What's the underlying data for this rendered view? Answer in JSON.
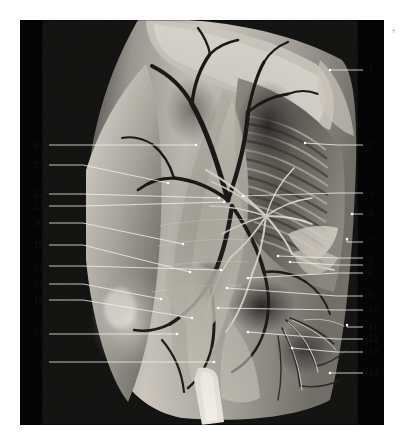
{
  "figure": {
    "kind": "anatomical-dissection-photograph",
    "panel_color": "#040404",
    "background_color": "#ffffff",
    "leader_line_color": "#f2f0ea",
    "label_color": "#111111",
    "corner_mark": "+"
  },
  "labels": {
    "left": [
      {
        "text": "24",
        "x": 44,
        "y": 145,
        "tip_x": 196,
        "tip_y": 145
      },
      {
        "text": "23",
        "x": 44,
        "y": 165,
        "tip_x": 168,
        "tip_y": 183
      },
      {
        "text": "22",
        "x": 44,
        "y": 194,
        "tip_x": 219,
        "tip_y": 198
      },
      {
        "text": "21",
        "x": 44,
        "y": 206,
        "tip_x": 224,
        "tip_y": 202
      },
      {
        "text": "20",
        "x": 44,
        "y": 223,
        "tip_x": 183,
        "tip_y": 244
      },
      {
        "text": "19",
        "x": 44,
        "y": 245,
        "tip_x": 190,
        "tip_y": 272
      },
      {
        "text": "18",
        "x": 44,
        "y": 266,
        "tip_x": 221,
        "tip_y": 270
      },
      {
        "text": "17",
        "x": 44,
        "y": 284,
        "tip_x": 161,
        "tip_y": 299
      },
      {
        "text": "16",
        "x": 44,
        "y": 300,
        "tip_x": 192,
        "tip_y": 318
      },
      {
        "text": "15",
        "x": 44,
        "y": 334,
        "tip_x": 177,
        "tip_y": 334
      },
      {
        "text": "4",
        "x": 44,
        "y": 362,
        "tip_x": 214,
        "tip_y": 362
      }
    ],
    "right": [
      {
        "text": "1",
        "x": 368,
        "y": 70,
        "tip_x": 330,
        "tip_y": 70
      },
      {
        "text": "2",
        "x": 368,
        "y": 145,
        "tip_x": 305,
        "tip_y": 143
      },
      {
        "text": "3",
        "x": 368,
        "y": 193,
        "tip_x": 243,
        "tip_y": 196
      },
      {
        "text": "4",
        "x": 368,
        "y": 214,
        "tip_x": 352,
        "tip_y": 214
      },
      {
        "text": "5",
        "x": 368,
        "y": 242,
        "tip_x": 347,
        "tip_y": 239
      },
      {
        "text": "6",
        "x": 368,
        "y": 258,
        "tip_x": 278,
        "tip_y": 256
      },
      {
        "text": "7",
        "x": 368,
        "y": 265,
        "tip_x": 290,
        "tip_y": 262
      },
      {
        "text": "8",
        "x": 368,
        "y": 273,
        "tip_x": 248,
        "tip_y": 278
      },
      {
        "text": "9",
        "x": 368,
        "y": 296,
        "tip_x": 227,
        "tip_y": 288
      },
      {
        "text": "10",
        "x": 368,
        "y": 310,
        "tip_x": 218,
        "tip_y": 308
      },
      {
        "text": "11",
        "x": 368,
        "y": 327,
        "tip_x": 347,
        "tip_y": 325
      },
      {
        "text": "12",
        "x": 368,
        "y": 339,
        "tip_x": 248,
        "tip_y": 332
      },
      {
        "text": "13",
        "x": 368,
        "y": 352,
        "tip_x": 292,
        "tip_y": 348
      },
      {
        "text": "14",
        "x": 368,
        "y": 373,
        "tip_x": 330,
        "tip_y": 373
      }
    ]
  }
}
